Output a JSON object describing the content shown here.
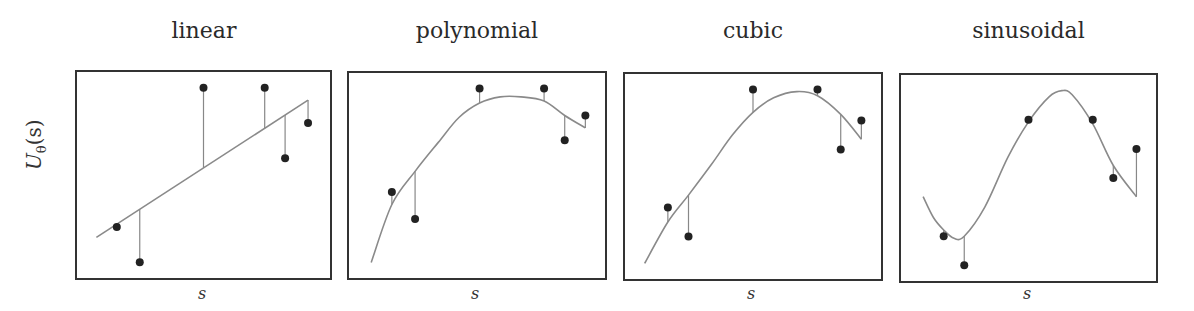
{
  "chart_data": [
    {
      "type": "scatter",
      "title": "linear",
      "xlabel": "s",
      "ylabel": "U_θ(s)",
      "xlim": [
        0,
        1
      ],
      "ylim": [
        0,
        1
      ],
      "grid": false,
      "points": {
        "x": [
          0.16,
          0.25,
          0.5,
          0.74,
          0.82,
          0.91
        ],
        "y": [
          0.25,
          0.08,
          0.92,
          0.92,
          0.58,
          0.75
        ]
      },
      "fit": {
        "x": [
          0.08,
          0.91
        ],
        "y": [
          0.2,
          0.86
        ]
      }
    },
    {
      "type": "scatter",
      "title": "polynomial",
      "xlabel": "s",
      "ylabel": "",
      "xlim": [
        0,
        1
      ],
      "ylim": [
        0,
        1
      ],
      "grid": false,
      "points": {
        "x": [
          0.17,
          0.26,
          0.51,
          0.76,
          0.84,
          0.92
        ],
        "y": [
          0.42,
          0.29,
          0.92,
          0.92,
          0.67,
          0.79
        ]
      },
      "fit": {
        "x": [
          0.09,
          0.17,
          0.26,
          0.35,
          0.43,
          0.51,
          0.59,
          0.67,
          0.76,
          0.84,
          0.92
        ],
        "y": [
          0.08,
          0.36,
          0.52,
          0.66,
          0.78,
          0.85,
          0.88,
          0.88,
          0.86,
          0.79,
          0.73
        ]
      }
    },
    {
      "type": "scatter",
      "title": "cubic",
      "xlabel": "s",
      "ylabel": "",
      "xlim": [
        0,
        1
      ],
      "ylim": [
        0,
        1
      ],
      "grid": false,
      "points": {
        "x": [
          0.17,
          0.25,
          0.5,
          0.75,
          0.84,
          0.92
        ],
        "y": [
          0.35,
          0.21,
          0.92,
          0.92,
          0.63,
          0.77
        ]
      },
      "fit": {
        "x": [
          0.08,
          0.17,
          0.25,
          0.34,
          0.42,
          0.5,
          0.58,
          0.67,
          0.75,
          0.84,
          0.92
        ],
        "y": [
          0.08,
          0.28,
          0.41,
          0.56,
          0.7,
          0.81,
          0.88,
          0.91,
          0.89,
          0.8,
          0.68
        ]
      }
    },
    {
      "type": "scatter",
      "title": "sinusoidal",
      "xlabel": "s",
      "ylabel": "",
      "xlim": [
        0,
        1
      ],
      "ylim": [
        0,
        1
      ],
      "grid": false,
      "points": {
        "x": [
          0.17,
          0.25,
          0.5,
          0.75,
          0.83,
          0.92
        ],
        "y": [
          0.22,
          0.08,
          0.78,
          0.78,
          0.5,
          0.64
        ]
      },
      "fit": {
        "x": [
          0.09,
          0.13,
          0.17,
          0.21,
          0.25,
          0.33,
          0.42,
          0.5,
          0.58,
          0.63,
          0.67,
          0.75,
          0.83,
          0.92
        ],
        "y": [
          0.41,
          0.31,
          0.25,
          0.21,
          0.22,
          0.36,
          0.6,
          0.77,
          0.89,
          0.92,
          0.9,
          0.76,
          0.56,
          0.41
        ]
      }
    }
  ],
  "ylabel_main": "U",
  "ylabel_sub": "θ",
  "ylabel_tail": "(s)",
  "colors": {
    "frame": "#333333",
    "curve": "#8a8a8a",
    "point": "#222222",
    "residual": "#888888"
  }
}
